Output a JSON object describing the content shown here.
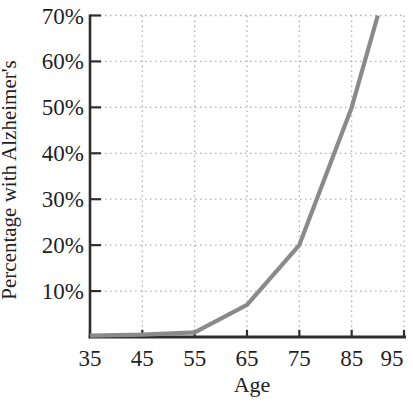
{
  "chart_data": {
    "type": "line",
    "title": "",
    "xlabel": "Age",
    "ylabel": "Percentage with Alzheimer's",
    "x": [
      35,
      45,
      55,
      65,
      75,
      85,
      90
    ],
    "values": [
      0.3,
      0.5,
      1,
      7,
      20,
      50,
      70
    ],
    "x_ticks": [
      35,
      45,
      55,
      65,
      75,
      85,
      95
    ],
    "y_ticks": [
      10,
      20,
      30,
      40,
      50,
      60,
      70
    ],
    "y_tick_suffix": "%",
    "xlim": [
      35,
      95
    ],
    "ylim": [
      0,
      70
    ],
    "grid": "dotted",
    "legend": "none",
    "colors": {
      "line": "#8a8a8a",
      "axis": "#2e2e2e",
      "grid": "#b0b0b0",
      "text": "#1f1f1f",
      "background": "#ffffff"
    }
  }
}
